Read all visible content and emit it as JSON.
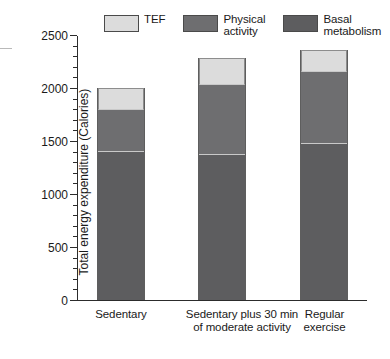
{
  "chart_data": {
    "type": "bar",
    "subtype": "stacked-vertical",
    "title": "",
    "xlabel": "",
    "ylabel": "Total energy expenditure (Calories)",
    "ylim": [
      0,
      2500
    ],
    "y_major_step": 500,
    "y_minor_step": 100,
    "grid": false,
    "legend_position": "top",
    "categories": [
      "Sedentary",
      "Sedentary plus 30 min\nof moderate activity",
      "Regular\nexercise"
    ],
    "series": [
      {
        "name": "Basal metabolism",
        "values": [
          1400,
          1370,
          1470
        ],
        "color": "#5d5d5f"
      },
      {
        "name": "Physical activity",
        "values": [
          390,
          660,
          680
        ],
        "color": "#6e6e70"
      },
      {
        "name": "TEF",
        "values": [
          210,
          250,
          210
        ],
        "color": "#dcdcdc"
      }
    ],
    "stack_tops": [
      {
        "basal": 1400,
        "physical": 1790,
        "tef": 2000
      },
      {
        "basal": 1370,
        "physical": 2030,
        "tef": 2280
      },
      {
        "basal": 1470,
        "physical": 2150,
        "tef": 2360
      }
    ],
    "totals": [
      2000,
      2280,
      2360
    ],
    "y_tick_labels": [
      "0",
      "500",
      "1000",
      "1500",
      "2000",
      "2500"
    ],
    "y_tick_values": [
      0,
      500,
      1000,
      1500,
      2000,
      2500
    ]
  },
  "legend": {
    "items": [
      {
        "label": "TEF",
        "color": "#dcdcdc"
      },
      {
        "label": "Physical\nactivity",
        "color": "#6e6e70"
      },
      {
        "label": "Basal\nmetabolism",
        "color": "#5d5d5f"
      }
    ]
  },
  "axes": {
    "y_title": "Total energy expenditure (Calories)"
  }
}
